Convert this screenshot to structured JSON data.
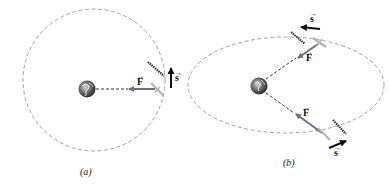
{
  "figure": {
    "panels": [
      {
        "id": "a",
        "caption": "(a)",
        "orbit": {
          "shape": "circle",
          "cx": 94,
          "cy": 80,
          "r": 71
        },
        "planet": {
          "name": "earth",
          "cx": 94,
          "cy": 89
        },
        "satellite": {
          "x": 158,
          "y": 89
        },
        "force_label": "F",
        "displacement_label": "s"
      },
      {
        "id": "b",
        "caption": "(b)",
        "orbit": {
          "shape": "ellipse",
          "cx": 286,
          "cy": 85,
          "rx": 98,
          "ry": 48
        },
        "planet": {
          "name": "earth",
          "cx": 258,
          "cy": 86
        },
        "satellites": [
          {
            "position": "top",
            "x": 320,
            "y": 43
          },
          {
            "position": "bottom",
            "x": 320,
            "y": 133
          }
        ],
        "force_labels": [
          "F",
          "F"
        ],
        "displacement_labels": [
          "s",
          "s"
        ]
      }
    ],
    "colors": {
      "orbit": "#8a8a8a",
      "force_arrow": "#707070",
      "displacement_arrow": "#111111",
      "earth_dark": "#3a3a3a",
      "earth_light": "#b0b0b0"
    }
  }
}
